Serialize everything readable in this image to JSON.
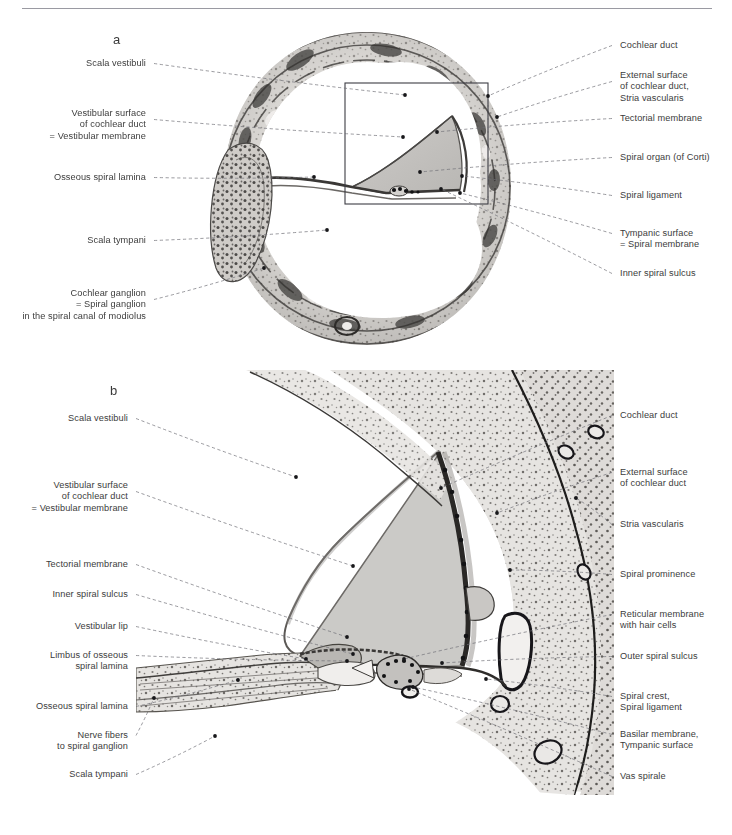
{
  "figure": {
    "panels": [
      {
        "id": "a",
        "letter": "a",
        "caption": "Cochlear cross-section, low magnification"
      },
      {
        "id": "b",
        "letter": "b",
        "caption": "Cochlear duct detail, high magnification"
      }
    ],
    "colors": {
      "leader_line": "#6e6e76",
      "label_text": "#3c3c3c",
      "rule": "#9a9aa2",
      "inset_box": "#3d3d44",
      "tissue_light": "#d7d5d2",
      "tissue_mid": "#a9a6a3",
      "tissue_dark": "#5a5856",
      "duct_fill": "#c6c5c2"
    }
  },
  "panel_a": {
    "letter": "a",
    "labels_left": [
      {
        "name": "scala-vestibuli",
        "lines": [
          "Scala vestibuli"
        ],
        "x": 146,
        "y": 58,
        "tip": [
          405,
          95
        ]
      },
      {
        "name": "vestibular-surface-of-cochlear-duct",
        "lines": [
          "Vestibular surface",
          "of cochlear duct",
          "= Vestibular membrane"
        ],
        "x": 146,
        "y": 108,
        "tip": [
          403,
          137
        ]
      },
      {
        "name": "osseous-spiral-lamina",
        "lines": [
          "Osseous spiral lamina"
        ],
        "x": 146,
        "y": 172,
        "tip": [
          314,
          177
        ]
      },
      {
        "name": "scala-tympani",
        "lines": [
          "Scala tympani"
        ],
        "x": 146,
        "y": 235,
        "tip": [
          327,
          230
        ]
      },
      {
        "name": "cochlear-ganglion",
        "lines": [
          "Cochlear ganglion",
          "= Spiral ganglion",
          "in the spiral canal of modiolus"
        ],
        "x": 146,
        "y": 288,
        "tip": [
          264,
          268
        ]
      }
    ],
    "labels_right": [
      {
        "name": "cochlear-duct",
        "lines": [
          "Cochlear duct"
        ],
        "x": 620,
        "y": 40,
        "tip": [
          488,
          96
        ]
      },
      {
        "name": "external-surface-stria-vascularis",
        "lines": [
          "External surface",
          "of cochlear duct,",
          "Stria vascularis"
        ],
        "x": 620,
        "y": 70,
        "tip": [
          497,
          117
        ]
      },
      {
        "name": "tectorial-membrane",
        "lines": [
          "Tectorial membrane"
        ],
        "x": 620,
        "y": 113,
        "tip": [
          437,
          132
        ]
      },
      {
        "name": "spiral-organ-of-corti",
        "lines": [
          "Spiral organ (of Corti)"
        ],
        "x": 620,
        "y": 152,
        "tip": [
          420,
          172
        ]
      },
      {
        "name": "spiral-ligament",
        "lines": [
          "Spiral ligament"
        ],
        "x": 620,
        "y": 190,
        "tip": [
          462,
          176
        ]
      },
      {
        "name": "tympanic-surface-spiral-membrane",
        "lines": [
          "Tympanic surface",
          "= Spiral membrane"
        ],
        "x": 620,
        "y": 228,
        "tip": [
          460,
          193
        ]
      },
      {
        "name": "inner-spiral-sulcus",
        "lines": [
          "Inner spiral sulcus"
        ],
        "x": 620,
        "y": 268,
        "tip": [
          441,
          189
        ]
      }
    ],
    "inset_box": {
      "x": 345,
      "y": 83,
      "width": 143,
      "height": 121
    }
  },
  "panel_b": {
    "letter": "b",
    "labels_left": [
      {
        "name": "scala-vestibuli",
        "lines": [
          "Scala vestibuli"
        ],
        "x": 128,
        "y": 413,
        "tip": [
          296,
          477
        ]
      },
      {
        "name": "vestibular-surface-of-cochlear-duct",
        "lines": [
          "Vestibular surface",
          "of cochlear duct",
          "= Vestibular membrane"
        ],
        "x": 128,
        "y": 480,
        "tip": [
          353,
          566
        ]
      },
      {
        "name": "tectorial-membrane",
        "lines": [
          "Tectorial membrane"
        ],
        "x": 128,
        "y": 559,
        "tip": [
          347,
          637
        ]
      },
      {
        "name": "inner-spiral-sulcus",
        "lines": [
          "Inner spiral sulcus"
        ],
        "x": 128,
        "y": 589,
        "tip": [
          353,
          654
        ]
      },
      {
        "name": "vestibular-lip",
        "lines": [
          "Vestibular lip"
        ],
        "x": 128,
        "y": 621,
        "tip": [
          306,
          659
        ]
      },
      {
        "name": "limbus-of-osseous-spiral-lamina",
        "lines": [
          "Limbus of osseous",
          "spiral lamina"
        ],
        "x": 128,
        "y": 650,
        "tip": [
          347,
          661
        ]
      },
      {
        "name": "osseous-spiral-lamina",
        "lines": [
          "Osseous spiral lamina"
        ],
        "x": 128,
        "y": 701,
        "tip": [
          238,
          680
        ]
      },
      {
        "name": "nerve-fibers-to-spiral-ganglion",
        "lines": [
          "Nerve fibers",
          "to spiral ganglion"
        ],
        "x": 128,
        "y": 730,
        "tip": [
          154,
          698
        ]
      },
      {
        "name": "scala-tympani",
        "lines": [
          "Scala tympani"
        ],
        "x": 128,
        "y": 769,
        "tip": [
          215,
          736
        ]
      }
    ],
    "labels_right": [
      {
        "name": "cochlear-duct",
        "lines": [
          "Cochlear duct"
        ],
        "x": 620,
        "y": 410,
        "tip": [
          441,
          488
        ]
      },
      {
        "name": "external-surface-of-cochlear-duct",
        "lines": [
          "External surface",
          "of cochlear duct"
        ],
        "x": 620,
        "y": 467,
        "tip": [
          497,
          513
        ]
      },
      {
        "name": "stria-vascularis",
        "lines": [
          "Stria vascularis"
        ],
        "x": 620,
        "y": 519,
        "tip": [
          576,
          498
        ]
      },
      {
        "name": "spiral-prominence",
        "lines": [
          "Spiral prominence"
        ],
        "x": 620,
        "y": 569,
        "tip": [
          510,
          570
        ]
      },
      {
        "name": "reticular-membrane-with-hair-cells",
        "lines": [
          "Reticular membrane",
          "with hair cells"
        ],
        "x": 620,
        "y": 609,
        "tip": [
          404,
          659
        ]
      },
      {
        "name": "outer-spiral-sulcus",
        "lines": [
          "Outer spiral sulcus"
        ],
        "x": 620,
        "y": 651,
        "tip": [
          442,
          663
        ]
      },
      {
        "name": "spiral-crest-spiral-ligament",
        "lines": [
          "Spiral crest,",
          "Spiral ligament"
        ],
        "x": 620,
        "y": 691,
        "tip": [
          486,
          679
        ]
      },
      {
        "name": "basilar-membrane-tympanic-surface",
        "lines": [
          "Basilar membrane,",
          "Tympanic surface"
        ],
        "x": 620,
        "y": 729,
        "tip": [
          413,
          687
        ]
      },
      {
        "name": "vas-spirale",
        "lines": [
          "Vas spirale"
        ],
        "x": 620,
        "y": 771,
        "tip": [
          409,
          689
        ]
      }
    ]
  }
}
